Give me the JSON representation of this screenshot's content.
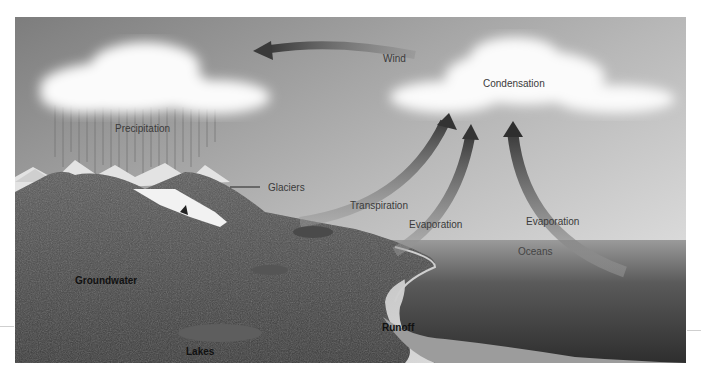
{
  "figure": {
    "style": "grayscale illustration",
    "colors": {
      "sky_top": "#8a8a8a",
      "sky_bottom": "#e6e6e6",
      "cloud": "#fafafa",
      "land": "#4a4a4a",
      "ocean": "#3e3e3e",
      "arrow": "#555555"
    }
  },
  "labels": {
    "wind": "Wind",
    "condensation": "Condensation",
    "precipitation": "Precipitation",
    "glaciers": "Glaciers",
    "transpiration": "Transpiration",
    "evaporation_land": "Evaporation",
    "evaporation_ocean": "Evaporation",
    "oceans": "Oceans",
    "groundwater": "Groundwater",
    "runoff": "Runoff",
    "lakes": "Lakes"
  },
  "arrows": [
    {
      "name": "wind-arrow",
      "direction": "left",
      "label": "Wind"
    },
    {
      "name": "transpiration-arrow",
      "direction": "up",
      "label": "Transpiration"
    },
    {
      "name": "evaporation-land-arrow",
      "direction": "up",
      "label": "Evaporation"
    },
    {
      "name": "evaporation-ocean-arrow",
      "direction": "up",
      "label": "Evaporation"
    }
  ]
}
